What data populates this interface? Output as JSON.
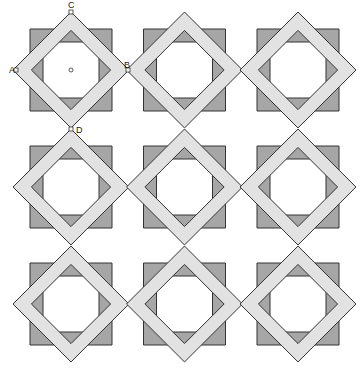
{
  "diagram": {
    "rows": 3,
    "cols": 3,
    "col_centers_x": [
      71,
      184.5,
      298
    ],
    "row_centers_y": [
      70,
      187,
      304
    ],
    "half_size": 41,
    "band_width": 13,
    "colors": {
      "dark_square": "#a6a6a6",
      "light_band": "#e2e2e2",
      "stroke": "#333333",
      "background": "#ffffff"
    },
    "labels": [
      {
        "text": "A",
        "x": 9,
        "y": 73,
        "point_x": 16,
        "point_y": 70
      },
      {
        "text": "B",
        "x": 124,
        "y": 68,
        "point_x": 128,
        "point_y": 70
      },
      {
        "text": "C",
        "x": 68,
        "y": 8,
        "point_x": 71,
        "point_y": 12
      },
      {
        "text": "D",
        "x": 76,
        "y": 133,
        "point_x": 71,
        "point_y": 129
      }
    ],
    "center_marker": {
      "x": 71,
      "y": 70
    }
  }
}
